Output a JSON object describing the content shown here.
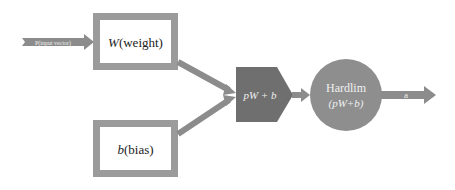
{
  "diagram": {
    "colors": {
      "box_border": "#9b9b9b",
      "box_fill": "#ffffff",
      "connector": "#8c8c8c",
      "sum_node": "#6f6f6f",
      "activation_node": "#8e8e8e",
      "text_dark": "#222222",
      "text_light": "#f0f0f0"
    },
    "input_arrow": {
      "label": "P(input vector)"
    },
    "weight_box": {
      "symbol": "W",
      "label": "(weight)"
    },
    "bias_box": {
      "symbol": "b",
      "label": "(bias)"
    },
    "sum_node": {
      "label": "pW + b"
    },
    "activation_node": {
      "line1": "Hardlim",
      "line2": "(pW+b)"
    },
    "output_arrow": {
      "label": "a"
    }
  }
}
